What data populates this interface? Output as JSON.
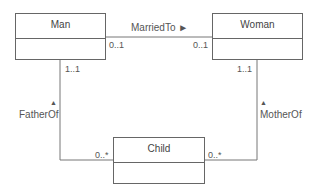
{
  "diagram": {
    "type": "UML class diagram",
    "classes": [
      {
        "id": "man",
        "name": "Man"
      },
      {
        "id": "woman",
        "name": "Woman"
      },
      {
        "id": "child",
        "name": "Child"
      }
    ],
    "associations": [
      {
        "name": "MarriedTo",
        "direction_arrow": "►",
        "from": "Man",
        "to": "Woman",
        "from_multiplicity": "0..1",
        "to_multiplicity": "0..1"
      },
      {
        "name": "FatherOf",
        "direction_arrow": "▲",
        "from": "Man",
        "to": "Child",
        "man_multiplicity": "1..1",
        "child_multiplicity": "0..*"
      },
      {
        "name": "MotherOf",
        "direction_arrow": "▲",
        "from": "Woman",
        "to": "Child",
        "woman_multiplicity": "1..1",
        "child_multiplicity": "0..*"
      }
    ]
  },
  "labels": {
    "married_to": "MarriedTo ►",
    "father_of_arrow": "▲",
    "father_of": "FatherOf",
    "mother_of_arrow": "▲",
    "mother_of": "MotherOf",
    "man_married_mult": "0..1",
    "woman_married_mult": "0..1",
    "man_father_mult": "1..1",
    "woman_mother_mult": "1..1",
    "child_father_mult": "0..*",
    "child_mother_mult": "0..*"
  }
}
